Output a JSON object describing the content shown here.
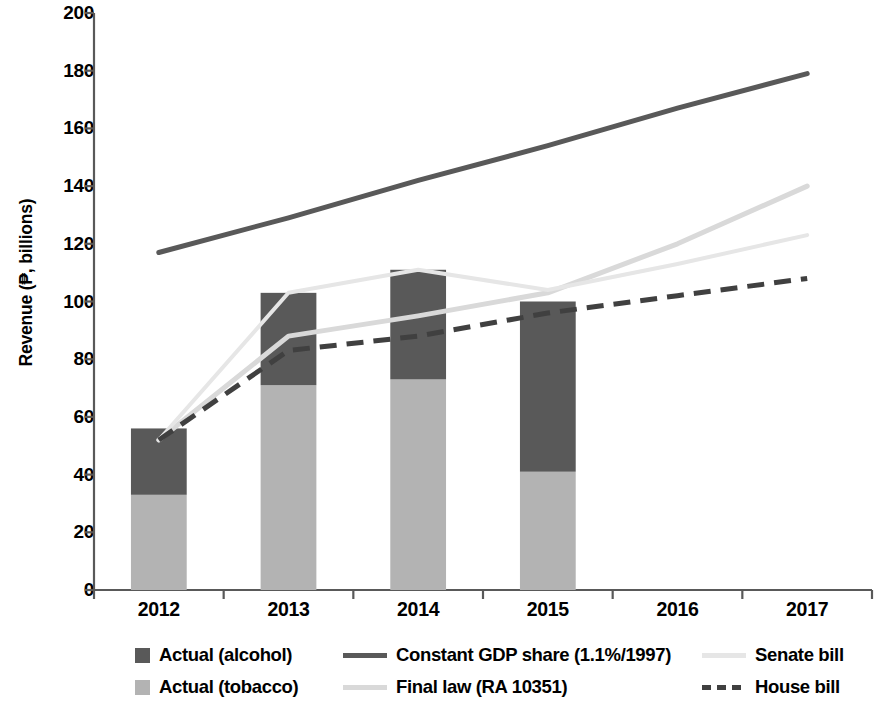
{
  "chart_data": {
    "type": "bar",
    "title": "",
    "xlabel": "",
    "ylabel": "Revenue (₱, billions)",
    "categories": [
      "2012",
      "2013",
      "2014",
      "2015",
      "2016",
      "2017"
    ],
    "ylim": [
      0,
      200
    ],
    "yticks": [
      0,
      20,
      40,
      60,
      80,
      100,
      120,
      140,
      160,
      180,
      200
    ],
    "grid": false,
    "legend_position": "bottom",
    "stacked_bars": {
      "series": [
        {
          "name": "Actual (tobacco)",
          "color": "#b3b3b3",
          "values": [
            33,
            71,
            73,
            41,
            null,
            null
          ]
        },
        {
          "name": "Actual (alcohol)",
          "color": "#595959",
          "values": [
            23,
            32,
            38,
            59,
            null,
            null
          ]
        }
      ],
      "totals": [
        56,
        103,
        111,
        100,
        null,
        null
      ]
    },
    "lines": [
      {
        "name": "Constant GDP share (1.1%/1997)",
        "color": "#595959",
        "style": "solid",
        "width": 5,
        "x": [
          "2012",
          "2013",
          "2014",
          "2015",
          "2016",
          "2017"
        ],
        "values": [
          117,
          129,
          142,
          154,
          167,
          179
        ]
      },
      {
        "name": "Final law (RA 10351)",
        "color": "#d9d9d9",
        "style": "solid",
        "width": 5,
        "x": [
          "2012",
          "2013",
          "2014",
          "2015",
          "2016",
          "2017"
        ],
        "values": [
          52,
          88,
          95,
          103,
          120,
          140
        ]
      },
      {
        "name": "Senate bill",
        "color": "#e6e6e6",
        "style": "solid",
        "width": 4,
        "x": [
          "2012",
          "2013",
          "2014",
          "2015",
          "2016",
          "2017"
        ],
        "values": [
          52,
          103,
          111,
          104,
          113,
          123
        ]
      },
      {
        "name": "House bill",
        "color": "#404040",
        "style": "dashed",
        "width": 5,
        "x": [
          "2012",
          "2013",
          "2014",
          "2015",
          "2016",
          "2017"
        ],
        "values": [
          52,
          83,
          88,
          96,
          102,
          108
        ]
      }
    ]
  },
  "legend": {
    "entries": [
      {
        "label": "Actual (alcohol)",
        "marker": "box",
        "color": "#595959"
      },
      {
        "label": "Constant GDP share (1.1%/1997)",
        "marker": "line",
        "color": "#595959"
      },
      {
        "label": "Senate bill",
        "marker": "line",
        "color": "#e6e6e6"
      },
      {
        "label": "Actual (tobacco)",
        "marker": "box",
        "color": "#b3b3b3"
      },
      {
        "label": "Final law (RA 10351)",
        "marker": "line",
        "color": "#d9d9d9"
      },
      {
        "label": "House bill",
        "marker": "dash",
        "color": "#404040"
      }
    ]
  },
  "axis": {
    "y_label": "Revenue (₱, billions)",
    "y_tick_labels": [
      "200",
      "180",
      "160",
      "140",
      "120",
      "100",
      "80",
      "60",
      "40",
      "20",
      "0"
    ],
    "x_tick_labels": [
      "2012",
      "2013",
      "2014",
      "2015",
      "2016",
      "2017"
    ]
  },
  "colors": {
    "alcohol": "#595959",
    "tobacco": "#b3b3b3",
    "gdp_line": "#595959",
    "final_law": "#d9d9d9",
    "senate": "#e6e6e6",
    "house": "#404040",
    "axis": "#595959"
  }
}
